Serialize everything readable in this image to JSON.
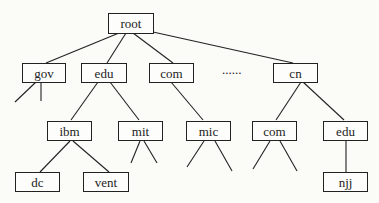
{
  "diagram": {
    "type": "tree",
    "title": "",
    "nodes": {
      "root": {
        "label": "root"
      },
      "gov": {
        "label": "gov"
      },
      "edu": {
        "label": "edu"
      },
      "com": {
        "label": "com"
      },
      "ellipsis": {
        "label": "......"
      },
      "cn": {
        "label": "cn"
      },
      "ibm": {
        "label": "ibm"
      },
      "mit": {
        "label": "mit"
      },
      "mic": {
        "label": "mic"
      },
      "cn_com": {
        "label": "com"
      },
      "cn_edu": {
        "label": "edu"
      },
      "dc": {
        "label": "dc"
      },
      "vent": {
        "label": "vent"
      },
      "njj": {
        "label": "njj"
      }
    },
    "edges": [
      [
        "root",
        "gov"
      ],
      [
        "root",
        "edu"
      ],
      [
        "root",
        "com"
      ],
      [
        "root",
        "cn"
      ],
      [
        "edu",
        "ibm"
      ],
      [
        "edu",
        "mit"
      ],
      [
        "com",
        "mic"
      ],
      [
        "cn",
        "cn_com"
      ],
      [
        "cn",
        "cn_edu"
      ],
      [
        "ibm",
        "dc"
      ],
      [
        "ibm",
        "vent"
      ],
      [
        "cn_edu",
        "njj"
      ]
    ],
    "open_branches": [
      "gov (2)",
      "mit (2)",
      "mic (2)",
      "cn_com (2)"
    ],
    "line_color": "#222222"
  }
}
